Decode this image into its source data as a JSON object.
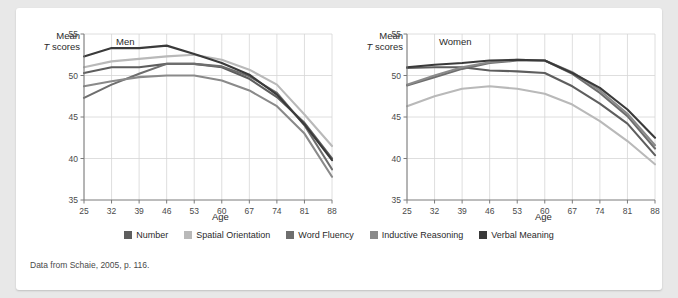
{
  "card": {
    "source_note": "Data from Schaie, 2005, p. 116."
  },
  "legend": {
    "items": [
      {
        "label": "Number",
        "color": "#5e5e5e"
      },
      {
        "label": "Spatial Orientation",
        "color": "#b9b9b9"
      },
      {
        "label": "Word Fluency",
        "color": "#6e6e6e"
      },
      {
        "label": "Inductive Reasoning",
        "color": "#8a8a8a"
      },
      {
        "label": "Verbal Meaning",
        "color": "#3a3a3a"
      }
    ]
  },
  "axis": {
    "y_title_line1": "Mean",
    "y_title_line2_italic": "T",
    "y_title_line2_rest": " scores",
    "x_name": "Age"
  },
  "panels": [
    {
      "tag": "Men"
    },
    {
      "tag": "Women"
    }
  ],
  "chart_data": [
    {
      "type": "line",
      "title": "Men",
      "xlabel": "Age",
      "ylabel": "Mean T scores",
      "x": [
        25,
        32,
        39,
        46,
        53,
        60,
        67,
        74,
        81,
        88
      ],
      "xticks": [
        "25",
        "32",
        "39",
        "46",
        "53",
        "60",
        "67",
        "74",
        "81",
        "88"
      ],
      "yticks": [
        "35",
        "40",
        "45",
        "50",
        "55"
      ],
      "ylim": [
        35,
        55
      ],
      "xlim": [
        25,
        88
      ],
      "grid": true,
      "legend_position": "bottom-shared",
      "series": [
        {
          "name": "Number",
          "color": "#5e5e5e",
          "values": [
            50.3,
            51.0,
            51.0,
            51.4,
            51.4,
            51.0,
            49.6,
            47.4,
            44.3,
            40.0
          ]
        },
        {
          "name": "Spatial Orientation",
          "color": "#b9b9b9",
          "values": [
            51.0,
            51.7,
            52.0,
            52.3,
            52.5,
            51.9,
            50.7,
            48.9,
            45.3,
            41.5
          ]
        },
        {
          "name": "Word Fluency",
          "color": "#6e6e6e",
          "values": [
            47.3,
            48.9,
            50.2,
            51.4,
            51.4,
            51.1,
            49.9,
            47.9,
            44.0,
            38.7
          ]
        },
        {
          "name": "Inductive Reasoning",
          "color": "#8a8a8a",
          "values": [
            48.7,
            49.3,
            49.8,
            50.0,
            50.0,
            49.4,
            48.2,
            46.3,
            43.0,
            37.8
          ]
        },
        {
          "name": "Verbal Meaning",
          "color": "#3a3a3a",
          "values": [
            52.3,
            53.3,
            53.3,
            53.6,
            52.6,
            51.5,
            50.1,
            47.7,
            44.1,
            39.8
          ]
        }
      ]
    },
    {
      "type": "line",
      "title": "Women",
      "xlabel": "Age",
      "ylabel": "Mean T scores",
      "x": [
        25,
        32,
        39,
        46,
        53,
        60,
        67,
        74,
        81,
        88
      ],
      "xticks": [
        "25",
        "32",
        "39",
        "46",
        "53",
        "60",
        "67",
        "74",
        "81",
        "88"
      ],
      "yticks": [
        "35",
        "40",
        "45",
        "50",
        "55"
      ],
      "ylim": [
        35,
        55
      ],
      "xlim": [
        25,
        88
      ],
      "grid": true,
      "legend_position": "bottom-shared",
      "series": [
        {
          "name": "Number",
          "color": "#5e5e5e",
          "values": [
            50.9,
            51.0,
            51.0,
            50.6,
            50.5,
            50.3,
            48.7,
            46.6,
            44.2,
            40.4
          ]
        },
        {
          "name": "Spatial Orientation",
          "color": "#b9b9b9",
          "values": [
            46.3,
            47.5,
            48.4,
            48.7,
            48.4,
            47.8,
            46.5,
            44.5,
            42.1,
            39.3
          ]
        },
        {
          "name": "Word Fluency",
          "color": "#6e6e6e",
          "values": [
            48.8,
            49.8,
            50.8,
            51.5,
            51.8,
            51.8,
            50.2,
            47.9,
            45.1,
            41.2
          ]
        },
        {
          "name": "Inductive Reasoning",
          "color": "#8a8a8a",
          "values": [
            48.9,
            50.0,
            51.0,
            51.6,
            51.9,
            51.8,
            50.4,
            48.2,
            45.4,
            41.6
          ]
        },
        {
          "name": "Verbal Meaning",
          "color": "#3a3a3a",
          "values": [
            51.0,
            51.3,
            51.5,
            51.8,
            51.9,
            51.8,
            50.3,
            48.5,
            45.9,
            42.5
          ]
        }
      ]
    }
  ]
}
